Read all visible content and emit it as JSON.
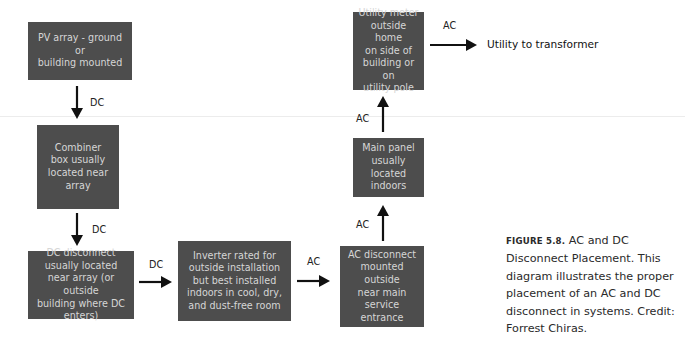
{
  "diagram": {
    "nodes": [
      {
        "id": "pv_array",
        "lines": [
          "PV array - ground or",
          "building mounted"
        ]
      },
      {
        "id": "combiner_box",
        "lines": [
          "Combiner",
          "box usually",
          "located near",
          "array"
        ]
      },
      {
        "id": "dc_disconnect",
        "lines": [
          "DC disconnect",
          "usually located",
          "near array (or outside",
          "building where DC",
          "enters)"
        ]
      },
      {
        "id": "inverter",
        "lines": [
          "Inverter rated for",
          "outside installation",
          "but best installed",
          "indoors in cool, dry,",
          "and dust-free room"
        ]
      },
      {
        "id": "ac_disconnect",
        "lines": [
          "AC disconnect",
          "mounted outside",
          "near main service",
          "entrance"
        ]
      },
      {
        "id": "main_panel",
        "lines": [
          "Main panel",
          "usually",
          "located indoors"
        ]
      },
      {
        "id": "utility_meter",
        "lines": [
          "Utility meter",
          "outside home",
          "on side of",
          "building or on",
          "utility pole"
        ]
      }
    ],
    "edges": [
      {
        "from": "pv_array",
        "to": "combiner_box",
        "label": "DC",
        "direction": "down"
      },
      {
        "from": "combiner_box",
        "to": "dc_disconnect",
        "label": "DC",
        "direction": "down"
      },
      {
        "from": "dc_disconnect",
        "to": "inverter",
        "label": "DC",
        "direction": "right"
      },
      {
        "from": "inverter",
        "to": "ac_disconnect",
        "label": "AC",
        "direction": "right"
      },
      {
        "from": "ac_disconnect",
        "to": "main_panel",
        "label": "AC",
        "direction": "up"
      },
      {
        "from": "main_panel",
        "to": "utility_meter",
        "label": "AC",
        "direction": "up"
      },
      {
        "from": "utility_meter",
        "to": "utility_to_transformer",
        "label": "AC",
        "direction": "right"
      }
    ],
    "destination": "Utility to transformer"
  },
  "caption": {
    "figure_label": "FIGURE 5.8.",
    "text": " AC and DC Disconnect Placement. This diagram illustrates the proper placement of an AC and DC disconnect in systems. Credit: Forrest Chiras."
  },
  "colors": {
    "box_fill": "#4d4d4d",
    "box_text": "#d6d6d6",
    "arrow": "#111111"
  }
}
